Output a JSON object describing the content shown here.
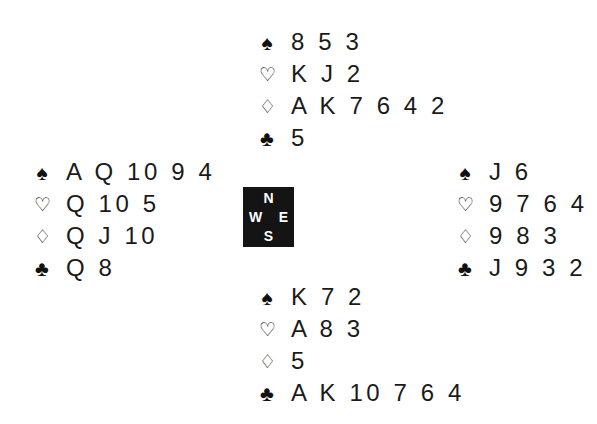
{
  "suits": {
    "spades": "♠",
    "hearts": "♡",
    "diamonds": "♢",
    "clubs": "♣"
  },
  "compass": {
    "north": "N",
    "south": "S",
    "west": "W",
    "east": "E"
  },
  "hands": {
    "north": {
      "spades": "8 5 3",
      "hearts": "K J 2",
      "diamonds": "A K 7 6 4 2",
      "clubs": "5"
    },
    "west": {
      "spades": "A Q 10 9 4",
      "hearts": "Q 10 5",
      "diamonds": "Q J 10",
      "clubs": "Q 8"
    },
    "east": {
      "spades": "J 6",
      "hearts": "9 7 6 4",
      "diamonds": "9 8 3",
      "clubs": "J 9 3 2"
    },
    "south": {
      "spades": "K 7 2",
      "hearts": "A 8 3",
      "diamonds": "5",
      "clubs": "A K 10 7 6 4"
    }
  }
}
